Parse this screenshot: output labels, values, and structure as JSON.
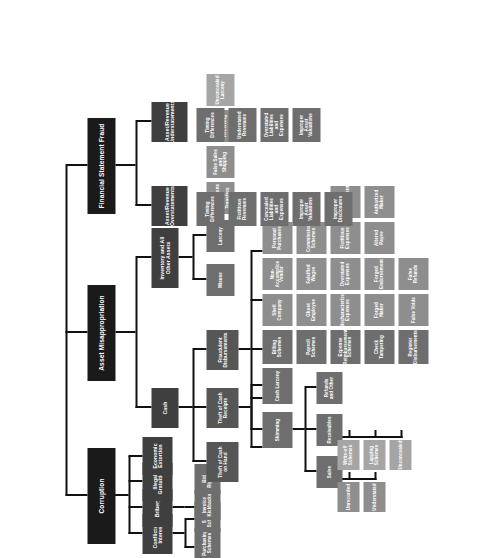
{
  "diagram": {
    "orientation": "rotated-90-counterclockwise",
    "colors": {
      "root": "#141414",
      "category": "#1a1a1a",
      "sub": "#3f3f3f",
      "sub2": "#565656",
      "leaf": "#6e6e6e",
      "leaf2": "#8e8e8e",
      "leaf3": "#a5a5a5",
      "edge": "#111111",
      "background": "#ffffff"
    }
  },
  "categories": {
    "corruption": "Corruption",
    "asset_misappropriation": "Asset Misappropriation",
    "financial_statement_fraud": "Financial Statement Fraud"
  },
  "corruption": {
    "conflicts_of_interest": "Conflicts of Interest",
    "conflicts_children": [
      "Purchasing Schemes",
      "Sales Schemes"
    ],
    "bribery": "Bribery",
    "bribery_children": [
      "Invoice Kickbacks",
      "Bid Rigging"
    ],
    "illegal_gratuities": "Illegal Gratuities",
    "economic_extortion": "Economic Extortion"
  },
  "asset_misappropriation": {
    "cash": "Cash",
    "cash_children": {
      "theft_of_cash_on_hand": "Theft of Cash on Hand",
      "theft_of_cash_receipts": "Theft of Cash Receipts",
      "fraudulent_disbursements": "Fraudulent Disbursements"
    },
    "theft_of_cash_receipts": {
      "skimming": "Skimming",
      "skimming_children": {
        "sales": "Sales",
        "sales_children": [
          "Unrecorded",
          "Understated"
        ],
        "receivables": "Receivables",
        "receivables_children": [
          "Write-off Schemes",
          "Lapping Schemes",
          "Unconcealed"
        ],
        "refunds_and_other": "Refunds and Other"
      },
      "cash_larceny": "Cash Larceny"
    },
    "fraudulent_disbursements": {
      "billing_schemes": "Billing Schemes",
      "billing_children": [
        "Shell Company",
        "Non-Accomplice Vendor",
        "Personal Purchases"
      ],
      "payroll_schemes": "Payroll Schemes",
      "payroll_children": [
        "Ghost Employee",
        "Falsified Wages",
        "Commission Schemes"
      ],
      "expense_reimbursements": "Expense Reimbursement Schemes",
      "expense_children": [
        "Mischaracterized Expenses",
        "Overstated Expenses",
        "Fictitious Expenses",
        "Multiple Reimbursements"
      ],
      "check_tampering": "Check Tampering",
      "check_children": [
        "Forged Maker",
        "Forged Endorsement",
        "Altered Payee",
        "Authorized Maker"
      ],
      "register_disbursements": "Register Disbursements",
      "register_children": [
        "False Voids",
        "False Refunds"
      ]
    },
    "inventory_and_all_other_assets": "Inventory and All Other Assets",
    "inventory_children": {
      "misuse": "Misuse",
      "larceny": "Larceny",
      "larceny_children": [
        "Asset Requisitions and Transfers",
        "False Sales and Shipping",
        "Purchasing and Receiving",
        "Unconcealed Larceny"
      ]
    }
  },
  "financial_statement_fraud": {
    "overstatements": "Asset/Revenue Overstatements",
    "overstatement_children": [
      "Timing Differences",
      "Fictitious Revenues",
      "Concealed Liabilities and Expenses",
      "Improper Asset Valuations",
      "Improper Disclosures"
    ],
    "understatements": "Asset/Revenue Understatements",
    "understatement_children": [
      "Timing Differences",
      "Understated Revenues",
      "Overstated Liabilities and Expenses",
      "Improper Asset Valuations"
    ]
  }
}
